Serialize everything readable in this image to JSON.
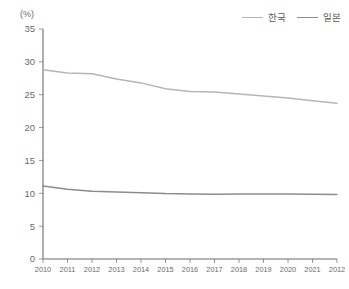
{
  "chart_data": {
    "type": "line",
    "title": "",
    "subtitle": "",
    "xlabel": "",
    "ylabel": "",
    "unit_label": "(%)",
    "grid": false,
    "legend_position": "top-right",
    "categories": [
      "2010",
      "2011",
      "2012",
      "2013",
      "2014",
      "2015",
      "2016",
      "2017",
      "2018",
      "2019",
      "2020",
      "2021",
      "2012"
    ],
    "x": [
      "2010",
      "2011",
      "2012",
      "2013",
      "2014",
      "2015",
      "2016",
      "2017",
      "2018",
      "2019",
      "2020",
      "2021",
      "2012"
    ],
    "ylim": [
      0,
      35
    ],
    "yticks": [
      "0",
      "5",
      "10",
      "15",
      "20",
      "25",
      "30",
      "35"
    ],
    "ytick_values": [
      0,
      5,
      10,
      15,
      20,
      25,
      30,
      35
    ],
    "series": [
      {
        "name": "한국",
        "color": "#b5b5b5",
        "values": [
          28.8,
          28.3,
          28.2,
          27.4,
          26.8,
          25.9,
          25.5,
          25.4,
          25.1,
          24.8,
          24.5,
          24.1,
          23.7
        ]
      },
      {
        "name": "일본",
        "color": "#8c8c8c",
        "values": [
          11.1,
          10.6,
          10.3,
          10.2,
          10.1,
          9.95,
          9.9,
          9.85,
          9.9,
          9.9,
          9.9,
          9.85,
          9.8
        ]
      }
    ]
  },
  "legend": {
    "items": [
      {
        "label": "한국",
        "color": "#b5b5b5"
      },
      {
        "label": "일본",
        "color": "#8c8c8c"
      }
    ]
  },
  "axis": {
    "unit": "(%)",
    "axis_color": "#6b6b6b"
  }
}
